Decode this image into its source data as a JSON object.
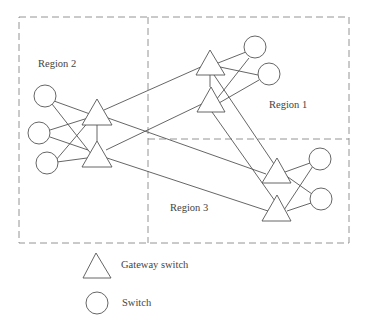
{
  "regions": [
    {
      "label": "Region 2",
      "x": 38,
      "y": 59
    },
    {
      "label": "Region 1",
      "x": 269,
      "y": 100
    },
    {
      "label": "Region 3",
      "x": 170,
      "y": 203
    }
  ],
  "legend": {
    "gateway_label": "Gateway switch",
    "switch_label": "Switch"
  },
  "colors": {
    "stroke": "#555555",
    "dash": "#888888",
    "text": "#444444"
  }
}
